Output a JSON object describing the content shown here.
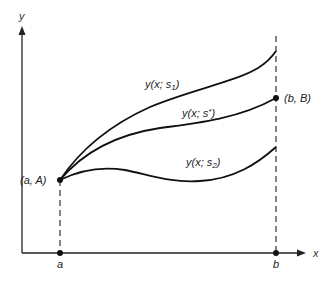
{
  "diagram": {
    "type": "shooting-method-illustration",
    "axes": {
      "x_label": "x",
      "y_label": "y"
    },
    "x_ticks": [
      {
        "label": "a"
      },
      {
        "label": "b"
      }
    ],
    "points": {
      "start": {
        "label": "(a, A)"
      },
      "end": {
        "label": "(b, B)"
      }
    },
    "curves": [
      {
        "id": "s1",
        "label_main": "y(x; s",
        "label_sub": "1",
        "label_end": ")"
      },
      {
        "id": "sstar",
        "label_main": "y(x; s",
        "label_sup": "*",
        "label_end": ")"
      },
      {
        "id": "s2",
        "label_main": "y(x; s",
        "label_sub": "2",
        "label_end": ")"
      }
    ],
    "colors": {
      "line": "#111111",
      "background": "#ffffff"
    }
  }
}
